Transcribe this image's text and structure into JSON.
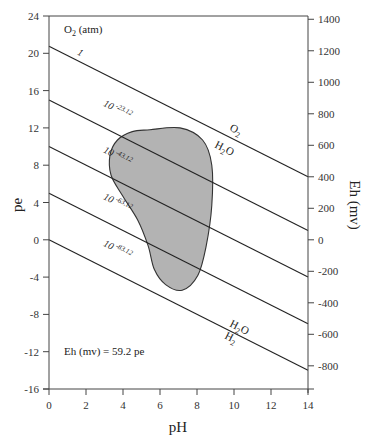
{
  "chart_data": {
    "type": "line",
    "title": "",
    "xlabel": "pH",
    "ylabel": "pe",
    "y2label": "Eh (mv)",
    "xlim": [
      0,
      14
    ],
    "ylim": [
      -16,
      24
    ],
    "y2lim": [
      -800,
      1400
    ],
    "grid": false,
    "x_ticks": [
      0,
      2,
      4,
      6,
      8,
      10,
      12,
      14
    ],
    "y_ticks": [
      24,
      20,
      16,
      12,
      8,
      4,
      0,
      -4,
      -8,
      -12,
      -16
    ],
    "y2_ticks": [
      1400,
      1200,
      1000,
      800,
      600,
      400,
      200,
      0,
      -200,
      -400,
      -600,
      -800
    ],
    "legend_header": "O2 (atm)",
    "series": [
      {
        "name": "1",
        "label_text": "1",
        "label_sup": "",
        "x": [
          0,
          14
        ],
        "y": [
          20.75,
          6.75
        ],
        "boundary_upper": "O2",
        "boundary_lower": "H2O"
      },
      {
        "name": "10^-23.12",
        "label_text": "10",
        "label_sup": "-23.12",
        "x": [
          0,
          14
        ],
        "y": [
          15,
          1
        ]
      },
      {
        "name": "10^-43.12",
        "label_text": "10",
        "label_sup": "-43.12",
        "x": [
          0,
          14
        ],
        "y": [
          10,
          -4
        ]
      },
      {
        "name": "10^-63.12",
        "label_text": "10",
        "label_sup": "-63.12",
        "x": [
          0,
          14
        ],
        "y": [
          5,
          -9
        ]
      },
      {
        "name": "10^-83.12",
        "label_text": "10",
        "label_sup": "-83.12",
        "x": [
          0,
          14
        ],
        "y": [
          0,
          -14
        ],
        "boundary_upper": "H2O",
        "boundary_lower": "H2"
      }
    ],
    "shaded_region": {
      "fill": "#b3b3b3",
      "outline_pH_pe": [
        [
          5.46,
          11.8
        ],
        [
          7.08,
          12.0
        ],
        [
          8.3,
          10.7
        ],
        [
          8.8,
          8.0
        ],
        [
          8.8,
          3.7
        ],
        [
          8.5,
          -0.6
        ],
        [
          8.05,
          -3.8
        ],
        [
          7.2,
          -5.4
        ],
        [
          6.3,
          -4.8
        ],
        [
          5.7,
          -3.2
        ],
        [
          5.35,
          -0.6
        ],
        [
          4.8,
          2.1
        ],
        [
          3.95,
          4.8
        ],
        [
          3.35,
          6.95
        ],
        [
          3.3,
          9.1
        ],
        [
          3.7,
          10.7
        ],
        [
          4.5,
          11.6
        ]
      ]
    },
    "annotations": [
      {
        "text": "Eh (mv) = 59.2 pe",
        "x": 1.0,
        "y": -11.8
      },
      {
        "text": "O2",
        "x": 10.0,
        "y": 9.3
      },
      {
        "text": "H2O",
        "x": 9.3,
        "y": 7.6
      },
      {
        "text": "H2O",
        "x": 9.6,
        "y": -7.6
      },
      {
        "text": "H2",
        "x": 9.3,
        "y": -9.1
      }
    ]
  },
  "labels": {
    "o2_header_main": "O",
    "o2_header_sub": "2",
    "o2_header_rest": " (atm)",
    "eq_note": "Eh (mv) = 59.2 pe",
    "xlabel": "pH",
    "ylabel": "pe",
    "y2label": "Eh (mv)",
    "o2": "O",
    "o2_sub": "2",
    "h2o_top": "H",
    "h2o_top_sub": "2",
    "h2o_top_rest": "O",
    "h2o_bot": "H",
    "h2o_bot_sub": "2",
    "h2o_bot_rest": "O",
    "h2": "H",
    "h2_sub": "2"
  }
}
